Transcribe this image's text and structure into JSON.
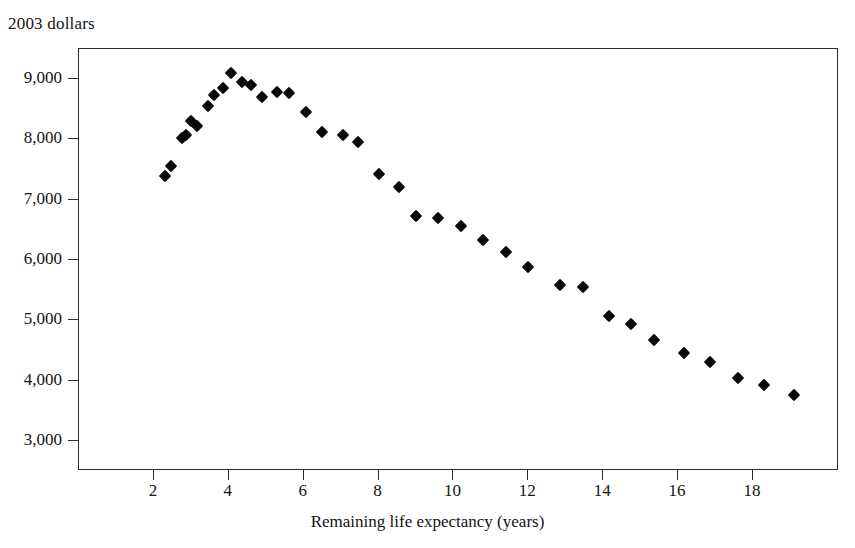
{
  "figure": {
    "y_axis_caption": "2003 dollars",
    "x_axis_caption": "Remaining life expectancy (years)",
    "marker_color": "#080808",
    "axis_color": "#2b2b2b",
    "background_color": "#ffffff"
  },
  "chart_data": {
    "type": "scatter",
    "title": "",
    "subtitle": "",
    "xlabel": "Remaining life expectancy (years)",
    "ylabel": "2003 dollars",
    "xlim": [
      0,
      20.3
    ],
    "ylim": [
      2500,
      9500
    ],
    "grid": false,
    "legend": null,
    "xticks": [
      2,
      4,
      6,
      8,
      10,
      12,
      14,
      16,
      18
    ],
    "xticklabels": [
      "2",
      "4",
      "6",
      "8",
      "10",
      "12",
      "14",
      "16",
      "18"
    ],
    "yticks": [
      3000,
      4000,
      5000,
      6000,
      7000,
      8000,
      9000
    ],
    "yticklabels": [
      "3,000",
      "4,000",
      "5,000",
      "6,000",
      "7,000",
      "8,000",
      "9,000"
    ],
    "marker": "diamond",
    "x": [
      2.3,
      2.45,
      2.75,
      2.85,
      3.0,
      3.15,
      3.45,
      3.6,
      3.85,
      4.05,
      4.35,
      4.6,
      4.9,
      5.3,
      5.6,
      6.05,
      6.5,
      7.05,
      7.45,
      8.0,
      8.55,
      9.0,
      9.6,
      10.2,
      10.8,
      11.4,
      12.0,
      12.85,
      13.45,
      14.15,
      14.75,
      15.35,
      16.15,
      16.85,
      17.6,
      18.3,
      19.1
    ],
    "y": [
      7400,
      7560,
      8030,
      8070,
      8300,
      8220,
      8560,
      8730,
      8860,
      9110,
      8950,
      8900,
      8700,
      8790,
      8770,
      8450,
      8120,
      8080,
      7960,
      7430,
      7210,
      6730,
      6700,
      6570,
      6340,
      6130,
      5880,
      5580,
      5550,
      5070,
      4940,
      4680,
      4460,
      4310,
      4050,
      3930,
      3760
    ],
    "points": [
      {
        "x": 2.3,
        "y": 7400
      },
      {
        "x": 2.45,
        "y": 7560
      },
      {
        "x": 2.75,
        "y": 8030
      },
      {
        "x": 2.85,
        "y": 8070
      },
      {
        "x": 3.0,
        "y": 8300
      },
      {
        "x": 3.15,
        "y": 8220
      },
      {
        "x": 3.45,
        "y": 8560
      },
      {
        "x": 3.6,
        "y": 8730
      },
      {
        "x": 3.85,
        "y": 8860
      },
      {
        "x": 4.05,
        "y": 9110
      },
      {
        "x": 4.35,
        "y": 8950
      },
      {
        "x": 4.6,
        "y": 8900
      },
      {
        "x": 4.9,
        "y": 8700
      },
      {
        "x": 5.3,
        "y": 8790
      },
      {
        "x": 5.6,
        "y": 8770
      },
      {
        "x": 6.05,
        "y": 8450
      },
      {
        "x": 6.5,
        "y": 8120
      },
      {
        "x": 7.05,
        "y": 8080
      },
      {
        "x": 7.45,
        "y": 7960
      },
      {
        "x": 8.0,
        "y": 7430
      },
      {
        "x": 8.55,
        "y": 7210
      },
      {
        "x": 9.0,
        "y": 6730
      },
      {
        "x": 9.6,
        "y": 6700
      },
      {
        "x": 10.2,
        "y": 6570
      },
      {
        "x": 10.8,
        "y": 6340
      },
      {
        "x": 11.4,
        "y": 6130
      },
      {
        "x": 12.0,
        "y": 5880
      },
      {
        "x": 12.85,
        "y": 5580
      },
      {
        "x": 13.45,
        "y": 5550
      },
      {
        "x": 14.15,
        "y": 5070
      },
      {
        "x": 14.75,
        "y": 4940
      },
      {
        "x": 15.35,
        "y": 4680
      },
      {
        "x": 16.15,
        "y": 4460
      },
      {
        "x": 16.85,
        "y": 4310
      },
      {
        "x": 17.6,
        "y": 4050
      },
      {
        "x": 18.3,
        "y": 3930
      },
      {
        "x": 19.1,
        "y": 3760
      }
    ]
  }
}
